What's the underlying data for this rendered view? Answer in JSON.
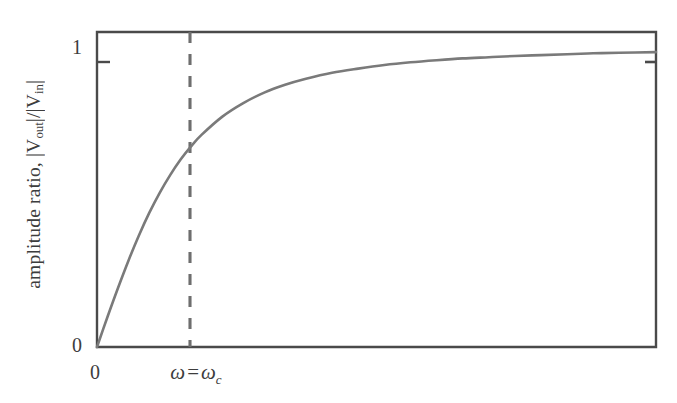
{
  "chart_data": {
    "type": "line",
    "title": "",
    "xlabel": "",
    "ylabel": "amplitude ratio, |Vout|/|Vin|",
    "ylabel_parts": {
      "prefix": "amplitude ratio, ",
      "numerator_var": "V",
      "numerator_sub": "out",
      "denominator_var": "V",
      "denominator_sub": "in"
    },
    "x_tick_labels": [
      "0"
    ],
    "y_tick_labels": [
      "0",
      "1"
    ],
    "xlim": [
      0,
      5.35
    ],
    "ylim": [
      0,
      1.05
    ],
    "grid": false,
    "legend": null,
    "annotations": [
      {
        "name": "cutoff-frequency-marker",
        "text": "ω = ω_c",
        "symbol": "ω",
        "equals": "=",
        "symbol2": "ω",
        "subscript": "c",
        "x": 1.0,
        "style": "dashed-vertical-line",
        "color": "#6e6e6e"
      }
    ],
    "series": [
      {
        "name": "amplitude ratio",
        "formula": "(w/wc)/sqrt(1+(w/wc)^2)",
        "color": "#7a7a7a",
        "x": [
          0,
          0.1,
          0.2,
          0.3,
          0.4,
          0.5,
          0.6,
          0.7,
          0.8,
          0.9,
          1.0,
          1.2,
          1.4,
          1.6,
          1.8,
          2.0,
          2.25,
          2.5,
          2.75,
          3.0,
          3.25,
          3.5,
          3.75,
          4.0,
          4.25,
          4.5,
          4.75,
          5.0,
          5.35
        ],
        "y": [
          0.0,
          0.1,
          0.196,
          0.287,
          0.371,
          0.447,
          0.514,
          0.573,
          0.625,
          0.669,
          0.707,
          0.768,
          0.813,
          0.848,
          0.874,
          0.894,
          0.914,
          0.928,
          0.94,
          0.949,
          0.956,
          0.962,
          0.966,
          0.97,
          0.973,
          0.976,
          0.979,
          0.981,
          0.983
        ]
      }
    ],
    "axis_color": "#4a4a4a",
    "background": "#ffffff",
    "plot_frame": "full-box"
  }
}
